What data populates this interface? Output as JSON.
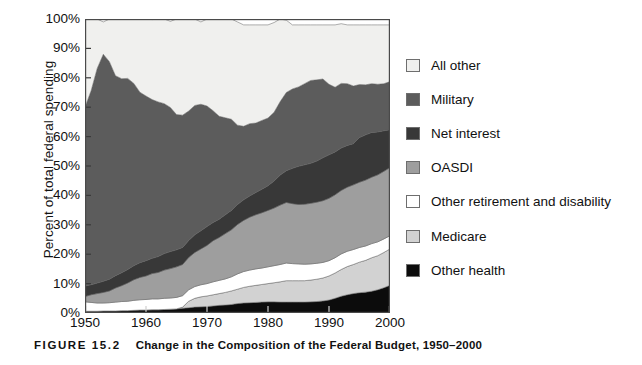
{
  "figure": {
    "number_label": "FIGURE 15.2",
    "caption": "Change in the Composition of the Federal Budget, 1950–2000"
  },
  "axes": {
    "ylabel": "Percent of total federal spending",
    "yticks": [
      "0%",
      "10%",
      "20%",
      "30%",
      "40%",
      "50%",
      "60%",
      "70%",
      "80%",
      "90%",
      "100%"
    ],
    "xticks": [
      "1950",
      "1960",
      "1970",
      "1980",
      "1990",
      "2000"
    ]
  },
  "legend": {
    "items": [
      {
        "label": "All other",
        "color": "#f0f0ee"
      },
      {
        "label": "Military",
        "color": "#5c5c5c"
      },
      {
        "label": "Net interest",
        "color": "#383838"
      },
      {
        "label": "OASDI",
        "color": "#9e9e9e"
      },
      {
        "label": "Other retirement and disability",
        "color": "#ffffff"
      },
      {
        "label": "Medicare",
        "color": "#d2d2d2"
      },
      {
        "label": "Other health",
        "color": "#0c0c0c"
      }
    ]
  },
  "chart_data": {
    "type": "area",
    "stacked": true,
    "title": "Change in the Composition of the Federal Budget, 1950–2000",
    "xlabel": "",
    "ylabel": "Percent of total federal spending",
    "xlim": [
      1950,
      2000
    ],
    "ylim": [
      0,
      100
    ],
    "grid": false,
    "legend_position": "right",
    "x": [
      1950,
      1951,
      1952,
      1953,
      1954,
      1955,
      1956,
      1957,
      1958,
      1959,
      1960,
      1961,
      1962,
      1963,
      1964,
      1965,
      1966,
      1967,
      1968,
      1969,
      1970,
      1971,
      1972,
      1973,
      1974,
      1975,
      1976,
      1977,
      1978,
      1979,
      1980,
      1981,
      1982,
      1983,
      1984,
      1985,
      1986,
      1987,
      1988,
      1989,
      1990,
      1991,
      1992,
      1993,
      1994,
      1995,
      1996,
      1997,
      1998,
      1999,
      2000
    ],
    "stack_order_bottom_to_top": [
      "Other health",
      "Medicare",
      "Other retirement and disability",
      "OASDI",
      "Net interest",
      "Military",
      "All other"
    ],
    "series": [
      {
        "name": "Other health",
        "values": [
          0.6,
          0.6,
          0.6,
          0.7,
          0.7,
          0.7,
          0.8,
          0.8,
          0.9,
          1.0,
          1.0,
          1.1,
          1.1,
          1.2,
          1.3,
          1.4,
          1.6,
          1.8,
          2.0,
          2.1,
          2.2,
          2.4,
          2.6,
          2.7,
          2.9,
          3.2,
          3.4,
          3.5,
          3.6,
          3.7,
          3.8,
          3.8,
          3.7,
          3.7,
          3.7,
          3.7,
          3.7,
          3.8,
          3.9,
          4.1,
          4.4,
          5.0,
          5.7,
          6.2,
          6.6,
          6.9,
          7.1,
          7.4,
          7.9,
          8.6,
          9.4
        ]
      },
      {
        "name": "Medicare",
        "values": [
          0,
          0,
          0,
          0,
          0,
          0,
          0,
          0,
          0,
          0,
          0,
          0,
          0,
          0,
          0,
          0,
          0.4,
          2.2,
          3.0,
          3.4,
          3.6,
          3.8,
          4.0,
          4.3,
          4.6,
          4.9,
          5.3,
          5.6,
          5.8,
          6.0,
          6.2,
          6.5,
          6.9,
          7.3,
          7.3,
          7.3,
          7.3,
          7.4,
          7.6,
          7.8,
          8.2,
          8.6,
          9.1,
          9.6,
          9.9,
          10.4,
          10.8,
          11.4,
          11.6,
          12.0,
          12.4
        ]
      },
      {
        "name": "Other retirement and disability",
        "values": [
          3.2,
          3.0,
          2.8,
          2.7,
          2.8,
          3.0,
          3.1,
          3.2,
          3.4,
          3.5,
          3.6,
          3.7,
          3.7,
          3.8,
          3.8,
          3.9,
          3.9,
          3.9,
          4.0,
          4.1,
          4.2,
          4.4,
          4.5,
          4.6,
          4.8,
          5.2,
          5.4,
          5.5,
          5.6,
          5.6,
          5.7,
          5.8,
          5.9,
          6.0,
          5.8,
          5.7,
          5.6,
          5.5,
          5.4,
          5.3,
          5.2,
          5.2,
          5.3,
          5.2,
          5.1,
          5.0,
          4.9,
          4.8,
          4.7,
          4.6,
          4.5
        ]
      },
      {
        "name": "OASDI",
        "values": [
          1.8,
          2.6,
          3.2,
          3.6,
          4.0,
          4.8,
          5.4,
          6.2,
          7.0,
          7.6,
          8.0,
          8.6,
          9.0,
          9.6,
          10.0,
          10.4,
          10.6,
          11.0,
          11.6,
          12.2,
          13.0,
          14.0,
          14.6,
          15.4,
          16.0,
          16.8,
          17.4,
          18.0,
          18.4,
          18.8,
          19.2,
          19.6,
          20.2,
          20.6,
          20.4,
          20.2,
          20.4,
          20.6,
          20.8,
          21.0,
          21.2,
          21.4,
          21.6,
          21.8,
          22.0,
          22.2,
          22.4,
          22.6,
          22.8,
          23.0,
          23.2
        ]
      },
      {
        "name": "Net interest",
        "values": [
          3.6,
          3.4,
          3.6,
          3.8,
          4.0,
          4.2,
          4.4,
          4.6,
          4.8,
          5.0,
          5.2,
          5.2,
          5.4,
          5.6,
          5.8,
          5.8,
          5.8,
          5.8,
          6.0,
          6.2,
          6.4,
          6.2,
          6.2,
          6.4,
          6.6,
          6.8,
          7.0,
          7.2,
          7.6,
          8.0,
          8.4,
          9.2,
          10.2,
          10.8,
          12.0,
          13.0,
          13.4,
          13.6,
          14.0,
          14.6,
          14.8,
          14.6,
          14.4,
          14.2,
          14.0,
          15.2,
          15.4,
          15.2,
          14.6,
          13.8,
          12.8
        ]
      },
      {
        "name": "Military",
        "values": [
          60.8,
          66.0,
          73.0,
          77.2,
          74.0,
          68.0,
          66.0,
          65.0,
          62.0,
          58.0,
          56.0,
          54.0,
          52.6,
          51.0,
          49.0,
          46.0,
          45.0,
          44.0,
          44.0,
          43.0,
          41.0,
          38.0,
          35.0,
          33.0,
          31.0,
          27.0,
          25.0,
          24.6,
          23.6,
          23.4,
          23.0,
          23.4,
          25.0,
          26.6,
          27.0,
          27.0,
          27.6,
          28.2,
          27.6,
          26.8,
          24.0,
          22.0,
          22.0,
          21.0,
          19.6,
          18.0,
          17.0,
          16.6,
          16.2,
          16.0,
          16.4
        ]
      },
      {
        "name": "All other",
        "values": [
          30.0,
          24.4,
          16.8,
          11.0,
          14.5,
          19.3,
          20.3,
          20.2,
          21.9,
          24.9,
          26.2,
          27.2,
          28.2,
          28.8,
          29.3,
          32.5,
          32.7,
          31.3,
          29.4,
          28.0,
          29.6,
          31.2,
          33.1,
          33.6,
          34.1,
          35.1,
          34.5,
          33.6,
          33.4,
          32.5,
          31.7,
          30.5,
          28.1,
          24.6,
          21.8,
          21.1,
          20.0,
          18.9,
          18.7,
          18.4,
          20.2,
          21.2,
          20.3,
          20.0,
          20.8,
          20.3,
          20.4,
          20.0,
          20.2,
          20.0,
          19.3
        ]
      }
    ]
  }
}
